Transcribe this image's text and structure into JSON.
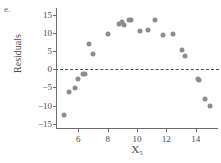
{
  "panel": {
    "label": "e."
  },
  "axes": {
    "ylabel": "Residuals",
    "xlabel_base": "X",
    "xlabel_sub": "5",
    "yticks": [
      15,
      10,
      5,
      0,
      -5,
      -10,
      -15
    ],
    "ytick_labels": [
      "15",
      "10",
      "5",
      "0",
      "−5",
      "−10",
      "−15"
    ],
    "xticks": [
      6,
      8,
      10,
      12,
      14
    ],
    "xtick_labels": [
      "6",
      "8",
      "10",
      "12",
      "14"
    ],
    "xlim": [
      4.55,
      15.45
    ],
    "ylim": [
      -16.2,
      16.6
    ],
    "zero_reference": 0
  },
  "style": {
    "point_color": "#8d8d8d",
    "axis_color": "#6b6b6b",
    "text_color": "#4a4a4a",
    "zero_line_color": "#4d4d4d",
    "background": "#ffffff"
  },
  "chart_data": {
    "type": "scatter",
    "title": "",
    "xlabel": "X5",
    "ylabel": "Residuals",
    "xlim": [
      4.55,
      15.45
    ],
    "ylim": [
      -16.2,
      16.6
    ],
    "grid": false,
    "legend": false,
    "reference_lines": [
      {
        "axis": "y",
        "value": 0,
        "style": "dashed"
      }
    ],
    "points": [
      {
        "x": 5.05,
        "y": -12.6
      },
      {
        "x": 5.35,
        "y": -6.2
      },
      {
        "x": 5.75,
        "y": -5.2
      },
      {
        "x": 6.0,
        "y": -2.7
      },
      {
        "x": 6.3,
        "y": -1.2
      },
      {
        "x": 6.45,
        "y": -1.2
      },
      {
        "x": 6.75,
        "y": 7.0
      },
      {
        "x": 7.0,
        "y": 4.2
      },
      {
        "x": 8.0,
        "y": 9.8
      },
      {
        "x": 8.75,
        "y": 12.4
      },
      {
        "x": 9.0,
        "y": 13.0
      },
      {
        "x": 9.1,
        "y": 12.1
      },
      {
        "x": 9.45,
        "y": 13.6
      },
      {
        "x": 9.6,
        "y": 13.6
      },
      {
        "x": 10.2,
        "y": 10.6
      },
      {
        "x": 10.75,
        "y": 10.7
      },
      {
        "x": 11.2,
        "y": 13.7
      },
      {
        "x": 11.75,
        "y": 9.5
      },
      {
        "x": 12.45,
        "y": 9.6
      },
      {
        "x": 13.05,
        "y": 5.2
      },
      {
        "x": 13.3,
        "y": 3.6
      },
      {
        "x": 14.15,
        "y": -2.6
      },
      {
        "x": 14.25,
        "y": -2.9
      },
      {
        "x": 14.6,
        "y": -8.3
      },
      {
        "x": 14.95,
        "y": -10.2
      }
    ]
  }
}
